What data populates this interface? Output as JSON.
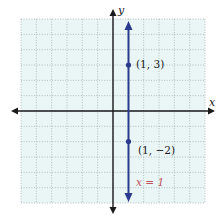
{
  "chart_data": {
    "type": "line",
    "title": "",
    "xlabel": "x",
    "ylabel": "y",
    "xlim": [
      -6,
      6
    ],
    "ylim": [
      -6,
      6
    ],
    "grid": true,
    "grid_step": 1,
    "series": [
      {
        "name": "x = 1",
        "kind": "vertical-line",
        "x_value": 1,
        "color": "#2b3a8f",
        "points": [
          {
            "x": 1,
            "y": 3,
            "label": "(1, 3)"
          },
          {
            "x": 1,
            "y": -2,
            "label": "(1, −2)"
          }
        ]
      }
    ],
    "annotations": [
      {
        "text": "x = 1",
        "color": "#c0505a"
      }
    ]
  },
  "labels": {
    "x_axis": "x",
    "y_axis": "y",
    "point_1": "(1, 3)",
    "point_2": "(1, −2)",
    "equation": "x = 1"
  },
  "colors": {
    "grid_bg": "#eaf6f6",
    "grid_line": "#9aa3a6",
    "axis": "#1a1a1a",
    "line": "#2b3a8f",
    "equation": "#c0505a"
  }
}
